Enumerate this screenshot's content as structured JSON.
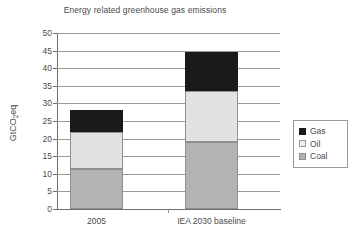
{
  "chart_data": {
    "type": "bar",
    "stacked": true,
    "title": "Energy related greenhouse gas emissions",
    "xlabel": "",
    "ylabel": "GtCO2eq",
    "ylabel_parts": {
      "pre": "GtCO",
      "sub": "2",
      "post": "eq"
    },
    "categories": [
      "2005",
      "IEA 2030 baseline"
    ],
    "series": [
      {
        "name": "Coal",
        "values": [
          11.4,
          19.0
        ],
        "color": "#b3b3b3"
      },
      {
        "name": "Oil",
        "values": [
          10.4,
          14.5
        ],
        "color": "#e2e2e2"
      },
      {
        "name": "Gas",
        "values": [
          6.2,
          11.1
        ],
        "color": "#1a1a1a"
      }
    ],
    "totals": [
      28.0,
      44.6
    ],
    "ylim": [
      0,
      50
    ],
    "ytick_step": 5,
    "yticks": [
      "50",
      "45",
      "40",
      "35",
      "30",
      "25",
      "20",
      "15",
      "10",
      "5",
      "0"
    ],
    "grid": true,
    "legend_position": "right",
    "legend_order": [
      "Gas",
      "Oil",
      "Coal"
    ]
  },
  "legend": {
    "items": [
      {
        "label": "Gas",
        "swatch": "gas"
      },
      {
        "label": "Oil",
        "swatch": "oil"
      },
      {
        "label": "Coal",
        "swatch": "coal"
      }
    ]
  }
}
